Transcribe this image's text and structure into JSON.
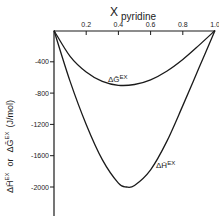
{
  "chart_data": {
    "type": "line",
    "title": "",
    "xlabel": "X pyridine",
    "xlabel_main": "X",
    "xlabel_sub": "pyridine",
    "ylabel": "ΔH̄EX or ΔḠEX (J/mol)",
    "ylabel_parts": {
      "h": "ΔH̄",
      "ex1": "EX",
      "or": "or",
      "g": "ΔḠ",
      "ex2": "EX",
      "unit": "(J/mol)"
    },
    "xlim": [
      0,
      1.0
    ],
    "ylim": [
      -2200,
      0
    ],
    "x_axis_position": "top",
    "grid": false,
    "x_ticks": [
      "0.2",
      "0.4",
      "0.6",
      "0.8",
      "1.0"
    ],
    "y_ticks": [
      "-400",
      "-800",
      "-1200",
      "-1600",
      "-2000"
    ],
    "series": [
      {
        "name": "ΔḠEX",
        "label_main": "ΔḠ",
        "label_sup": "EX",
        "x": [
          0,
          0.1,
          0.2,
          0.3,
          0.4,
          0.5,
          0.6,
          0.7,
          0.8,
          0.9,
          1.0
        ],
        "values": [
          0,
          -330,
          -530,
          -650,
          -700,
          -690,
          -630,
          -520,
          -370,
          -190,
          0
        ]
      },
      {
        "name": "ΔH̄EX",
        "label_main": "ΔH̄",
        "label_sup": "EX",
        "x": [
          0,
          0.1,
          0.2,
          0.3,
          0.4,
          0.45,
          0.5,
          0.6,
          0.7,
          0.8,
          0.9,
          1.0
        ],
        "values": [
          0,
          -650,
          -1200,
          -1650,
          -1950,
          -2000,
          -1980,
          -1780,
          -1420,
          -960,
          -480,
          0
        ]
      }
    ]
  }
}
